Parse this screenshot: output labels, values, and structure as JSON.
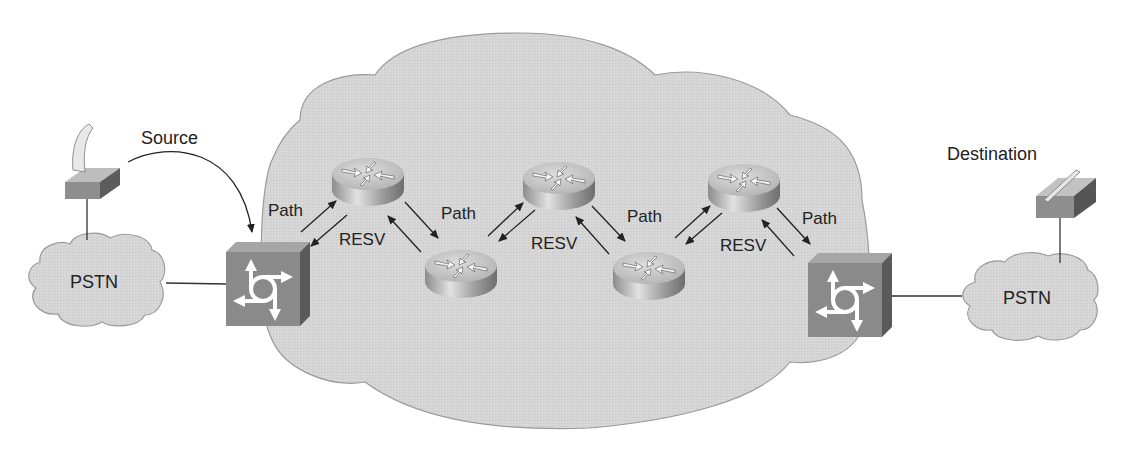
{
  "diagram": {
    "colors": {
      "background": "#ffffff",
      "cloud_fill": "#d4d4d4",
      "cloud_stroke": "#9a9a9a",
      "switch_front": "#8a8a8a",
      "switch_top": "#a8a8a8",
      "switch_side": "#5e5e5e",
      "router_top": "#c9c9c9",
      "router_side": "#9a9a9a",
      "line": "#333333",
      "text": "#222222"
    },
    "labels": {
      "source": "Source",
      "destination": "Destination",
      "pstn_left": "PSTN",
      "pstn_right": "PSTN"
    },
    "messages": [
      {
        "id": "path-1",
        "label": "Path",
        "from": "gateway-left",
        "to": "router-1"
      },
      {
        "id": "resv-1",
        "label": "RESV",
        "from": "router-1",
        "to": "gateway-left"
      },
      {
        "id": "path-2",
        "label": "Path",
        "from": "router-1",
        "to": "router-2"
      },
      {
        "id": "resv-2",
        "label": "RESV",
        "from": "router-3",
        "to": "router-2"
      },
      {
        "id": "path-3",
        "label": "Path",
        "from": "router-3",
        "to": "router-4"
      },
      {
        "id": "resv-3",
        "label": "RESV",
        "from": "router-5",
        "to": "router-4"
      },
      {
        "id": "path-4",
        "label": "Path",
        "from": "router-5",
        "to": "gateway-right"
      }
    ],
    "nodes": [
      {
        "id": "phone-left",
        "type": "telephone"
      },
      {
        "id": "pstn-left",
        "type": "pstn-cloud"
      },
      {
        "id": "gateway-left",
        "type": "voice-gateway-switch"
      },
      {
        "id": "router-1",
        "type": "router"
      },
      {
        "id": "router-2",
        "type": "router"
      },
      {
        "id": "router-3",
        "type": "router"
      },
      {
        "id": "router-4",
        "type": "router"
      },
      {
        "id": "router-5",
        "type": "router"
      },
      {
        "id": "gateway-right",
        "type": "voice-gateway-switch"
      },
      {
        "id": "pstn-right",
        "type": "pstn-cloud"
      },
      {
        "id": "phone-right",
        "type": "telephone"
      },
      {
        "id": "ip-network",
        "type": "network-cloud"
      }
    ]
  }
}
